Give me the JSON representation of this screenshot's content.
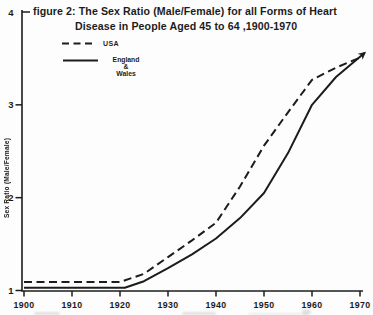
{
  "header": {
    "title_line1": "figure 2: The Sex Ratio (Male/Female) for all Forms of Heart",
    "title_line2": "Disease in People Aged 45 to 64 ,1900-1970"
  },
  "legend": {
    "items": [
      {
        "label_lines": [
          "USA"
        ],
        "style": "dashed"
      },
      {
        "label_lines": [
          "England",
          "&",
          "Wales"
        ],
        "style": "solid"
      }
    ]
  },
  "axes": {
    "y_label": "Sex Ratio (Male/Female)",
    "x_tick_labels": [
      "1900",
      "1910",
      "1920",
      "1930",
      "1940",
      "1950",
      "1960",
      "1970"
    ],
    "y_tick_labels": [
      "1",
      "2",
      "3",
      "4"
    ]
  },
  "colors": {
    "ink": "#1c1c1c",
    "paper": "#fdfdfd"
  },
  "chart_data": {
    "type": "line",
    "xlabel": "",
    "ylabel": "Sex Ratio (Male/Female)",
    "xlim": [
      1900,
      1972
    ],
    "ylim": [
      1,
      4
    ],
    "x_ticks": [
      1900,
      1910,
      1920,
      1930,
      1940,
      1950,
      1960,
      1970
    ],
    "y_ticks": [
      1,
      2,
      3,
      4
    ],
    "grid": false,
    "legend_position": "top-left",
    "series": [
      {
        "name": "USA",
        "style": "dashed",
        "end_arrow": false,
        "x": [
          1900,
          1910,
          1920,
          1925,
          1930,
          1935,
          1940,
          1945,
          1950,
          1955,
          1960,
          1965,
          1970.5
        ],
        "values": [
          1.09,
          1.09,
          1.09,
          1.18,
          1.36,
          1.54,
          1.73,
          2.12,
          2.56,
          2.92,
          3.27,
          3.4,
          3.52
        ]
      },
      {
        "name": "England & Wales",
        "style": "solid",
        "end_arrow": true,
        "x": [
          1900,
          1910,
          1921,
          1925,
          1930,
          1935,
          1940,
          1945,
          1950,
          1955,
          1960,
          1965,
          1971
        ],
        "values": [
          1.03,
          1.03,
          1.03,
          1.1,
          1.24,
          1.39,
          1.56,
          1.78,
          2.05,
          2.48,
          3.0,
          3.3,
          3.56
        ]
      }
    ]
  }
}
